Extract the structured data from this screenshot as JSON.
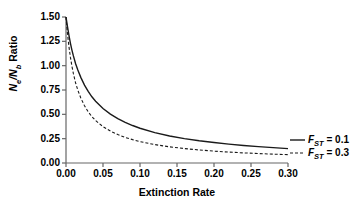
{
  "chart_data": {
    "type": "line",
    "title": "",
    "xlabel": "Extinction Rate",
    "ylabel": "Ne/Nb Ratio",
    "ylabel_parts": {
      "n1": "N",
      "sub1": "e",
      "slash": "/",
      "n2": "N",
      "sub2": "b",
      "rest": " Ratio"
    },
    "xlim": [
      0.0,
      0.3
    ],
    "ylim": [
      0.0,
      1.5
    ],
    "xticks": [
      "0.00",
      "0.05",
      "0.10",
      "0.15",
      "0.20",
      "0.25",
      "0.30"
    ],
    "xtick_values": [
      0.0,
      0.05,
      0.1,
      0.15,
      0.2,
      0.25,
      0.3
    ],
    "yticks": [
      "0.00",
      "0.25",
      "0.50",
      "0.75",
      "1.00",
      "1.25",
      "1.50"
    ],
    "ytick_values": [
      0.0,
      0.25,
      0.5,
      0.75,
      1.0,
      1.25,
      1.5
    ],
    "grid": false,
    "legend_position": "right-outside",
    "series": [
      {
        "name": "FST = 0.1",
        "label_prefix": "F",
        "label_sub": "ST",
        "label_suffix": " = 0.1",
        "style": "solid",
        "color": "#1a1a1a",
        "x": [
          0.0,
          0.002,
          0.004,
          0.006,
          0.008,
          0.01,
          0.013,
          0.016,
          0.02,
          0.025,
          0.03,
          0.035,
          0.04,
          0.05,
          0.06,
          0.07,
          0.08,
          0.09,
          0.1,
          0.12,
          0.14,
          0.16,
          0.18,
          0.2,
          0.22,
          0.24,
          0.26,
          0.28,
          0.3
        ],
        "y": [
          1.5,
          1.4,
          1.31,
          1.23,
          1.16,
          1.1,
          1.02,
          0.955,
          0.88,
          0.8,
          0.735,
          0.68,
          0.635,
          0.56,
          0.502,
          0.455,
          0.417,
          0.385,
          0.357,
          0.312,
          0.278,
          0.25,
          0.228,
          0.21,
          0.194,
          0.18,
          0.168,
          0.158,
          0.148
        ]
      },
      {
        "name": "FST = 0.3",
        "label_prefix": "F",
        "label_sub": "ST",
        "label_suffix": " = 0.3",
        "style": "dashed",
        "color": "#1a1a1a",
        "x": [
          0.0,
          0.002,
          0.004,
          0.006,
          0.008,
          0.01,
          0.013,
          0.016,
          0.02,
          0.025,
          0.03,
          0.035,
          0.04,
          0.05,
          0.06,
          0.07,
          0.08,
          0.09,
          0.1,
          0.12,
          0.14,
          0.16,
          0.18,
          0.2,
          0.22,
          0.24,
          0.26,
          0.28,
          0.3
        ],
        "y": [
          1.5,
          1.33,
          1.195,
          1.085,
          0.995,
          0.918,
          0.822,
          0.748,
          0.668,
          0.588,
          0.526,
          0.476,
          0.436,
          0.374,
          0.328,
          0.292,
          0.263,
          0.24,
          0.22,
          0.189,
          0.166,
          0.148,
          0.134,
          0.122,
          0.112,
          0.104,
          0.097,
          0.091,
          0.086
        ]
      }
    ]
  },
  "axis": {
    "color": "#555555"
  }
}
